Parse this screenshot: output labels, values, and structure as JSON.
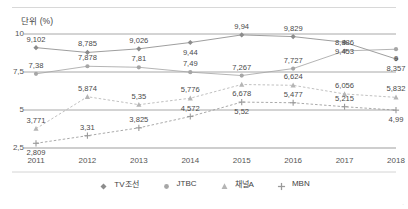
{
  "header": {
    "unit_title": "단위 (%)"
  },
  "chart_data": {
    "type": "line",
    "title": "단위 (%)",
    "xlabel": "",
    "ylabel": "",
    "ylim": [
      2.5,
      10
    ],
    "yticks": [
      10,
      7.5,
      5,
      2.5
    ],
    "ytick_labels": [
      "10",
      "7,5",
      "5",
      "2,5"
    ],
    "grid": true,
    "legend_position": "bottom",
    "decimal_separator": ",",
    "categories": [
      "2011",
      "2012",
      "2013",
      "2014",
      "2015",
      "2016",
      "2017",
      "2018"
    ],
    "series": [
      {
        "name": "TV조선",
        "marker": "diamond",
        "color": "#8c8c8c",
        "values": [
          9.102,
          8.785,
          9.026,
          9.44,
          9.94,
          9.829,
          9.453,
          8.357
        ],
        "labels": [
          "9,102",
          "8,785",
          "9,026",
          "9,44",
          "9,94",
          "9,829",
          "9,453",
          "8,357"
        ]
      },
      {
        "name": "JTBC",
        "marker": "circle",
        "color": "#a6a6a6",
        "values": [
          7.38,
          7.878,
          7.81,
          7.49,
          7.267,
          7.727,
          8.886,
          9.0
        ],
        "labels": [
          "7,38",
          "7,878",
          "7,81",
          "7,49",
          "7,267",
          "7,727",
          "8,886",
          "9"
        ]
      },
      {
        "name": "채널A",
        "marker": "triangle",
        "color": "#b5b5b5",
        "values": [
          3.771,
          5.874,
          5.35,
          5.776,
          6.678,
          6.624,
          6.056,
          5.832
        ],
        "labels": [
          "3,771",
          "5,874",
          "5,35",
          "5,776",
          "6,678",
          "6,624",
          "6,056",
          "5,832"
        ]
      },
      {
        "name": "MBN",
        "marker": "plus",
        "color": "#9a9a9a",
        "values": [
          2.809,
          3.31,
          3.825,
          4.572,
          5.52,
          5.477,
          5.215,
          4.99
        ],
        "labels": [
          "2,809",
          "3,31",
          "3,825",
          "4,572",
          "5,52",
          "5,477",
          "5,215",
          "4,99"
        ]
      }
    ]
  },
  "legend": {
    "items": [
      {
        "label": "TV조선",
        "marker": "diamond-marker-icon"
      },
      {
        "label": "JTBC",
        "marker": "circle-marker-icon"
      },
      {
        "label": "채널A",
        "marker": "triangle-marker-icon"
      },
      {
        "label": "MBN",
        "marker": "plus-marker-icon"
      }
    ]
  }
}
